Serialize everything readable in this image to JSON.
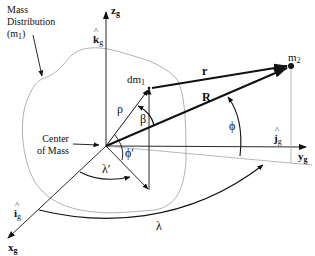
{
  "diagram": {
    "labels": {
      "mass_distribution_line1": "Mass",
      "mass_distribution_line2": "Distribution",
      "mass_distribution_line3": "(m",
      "mass_distribution_sub": "1",
      "mass_distribution_close": ")",
      "center_of_mass_line1": "Center",
      "center_of_mass_line2": "of Mass",
      "dm1": "dm",
      "dm1_sub": "1",
      "m2": "m",
      "m2_sub": "2",
      "r_vec": "r",
      "R_vec": "R",
      "rho": "ρ",
      "beta": "β",
      "phi": "ϕ",
      "phi_prime": "ϕ′",
      "lambda": "λ",
      "lambda_prime": "λ′",
      "z_axis": "z",
      "z_axis_sub": "g",
      "y_axis": "y",
      "y_axis_sub": "g",
      "x_axis": "x",
      "x_axis_sub": "g",
      "k_hat": "k",
      "k_hat_sub": "g",
      "j_hat": "j",
      "j_hat_sub": "g",
      "i_hat": "i",
      "i_hat_sub": "g"
    },
    "colors": {
      "ink": "#111111",
      "outline": "#a8a8a8",
      "guide": "#9a9a9a"
    }
  }
}
